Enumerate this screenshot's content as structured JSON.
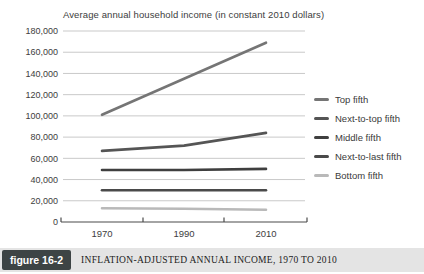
{
  "chart_data": {
    "type": "line",
    "title": "Average annual household income (in constant 2010 dollars)",
    "x": [
      1970,
      1990,
      2010
    ],
    "x_tick_labels": [
      "1970",
      "1990",
      "2010"
    ],
    "ylim": [
      0,
      180000
    ],
    "y_ticks": [
      0,
      20000,
      40000,
      60000,
      80000,
      100000,
      120000,
      140000,
      160000,
      180000
    ],
    "y_tick_labels": [
      "0",
      "20,000",
      "40,000",
      "60,000",
      "80,000",
      "100,000",
      "120,000",
      "140,000",
      "160,000",
      "180,000"
    ],
    "grid": "horizontal-gridlines",
    "legend_position": "right",
    "series": [
      {
        "name": "Top fifth",
        "values": [
          101000,
          135000,
          169000
        ],
        "color": "#757575"
      },
      {
        "name": "Next-to-top fifth",
        "values": [
          67000,
          72000,
          84000
        ],
        "color": "#555555"
      },
      {
        "name": "Middle fifth",
        "values": [
          49000,
          49000,
          50000
        ],
        "color": "#3f3f3f"
      },
      {
        "name": "Next-to-last fifth",
        "values": [
          30000,
          30000,
          30000
        ],
        "color": "#4a4a4a"
      },
      {
        "name": "Bottom fifth",
        "values": [
          13000,
          12500,
          11500
        ],
        "color": "#b9b9b9"
      }
    ]
  },
  "caption": {
    "figure_label": "figure 16-2",
    "text": "INFLATION-ADJUSTED ANNUAL INCOME, 1970 TO 2010"
  },
  "colors": {
    "background": "#ffffff",
    "gridline": "#c9c9c9",
    "axis": "#4a4a4a",
    "tick_text": "#3d3d3d",
    "caption_bar_bg": "#e4e4e4",
    "figure_badge_bg": "#3d4445",
    "figure_badge_text": "#ffffff",
    "caption_text": "#1b1b1b"
  }
}
